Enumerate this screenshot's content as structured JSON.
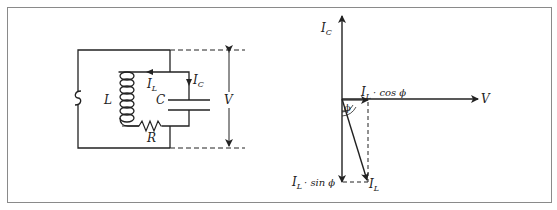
{
  "figure": {
    "circuit": {
      "source_symbol": "∿",
      "inductor": {
        "label": "L"
      },
      "capacitor": {
        "label": "C"
      },
      "resistor": {
        "label": "R"
      },
      "current_inductor": {
        "main": "I",
        "sub": "L"
      },
      "current_capacitor": {
        "main": "I",
        "sub": "C"
      },
      "voltage": {
        "label": "V"
      }
    },
    "phasor": {
      "ic_label": {
        "main": "I",
        "sub": "C"
      },
      "v_label": "V",
      "il_label": {
        "main": "I",
        "sub": "L"
      },
      "cos_label": {
        "main": "I",
        "sub": "L",
        "rest": "· cos ϕ"
      },
      "sin_label": {
        "main": "I",
        "sub": "L",
        "rest": "· sin ϕ"
      },
      "angle_label": "ϕ"
    }
  },
  "colors": {
    "ink": "#222222",
    "frame": "#8a8a8a"
  }
}
